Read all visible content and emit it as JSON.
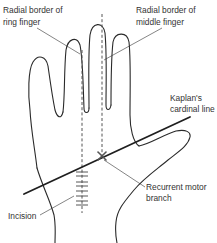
{
  "labels": {
    "ring_finger": {
      "line1": "Radial border of",
      "line2": "ring finger"
    },
    "middle_finger": {
      "line1": "Radial border of",
      "line2": "middle finger"
    },
    "kaplan": {
      "line1": "Kaplan's",
      "line2": "cardinal line"
    },
    "motor_branch": {
      "line1": "Recurrent motor",
      "line2": "branch"
    },
    "incision": {
      "text": "Incision"
    }
  },
  "colors": {
    "outline": "#2a2a2a",
    "text": "#333333",
    "dashed_guides": "#555555",
    "background": "#ffffff"
  }
}
